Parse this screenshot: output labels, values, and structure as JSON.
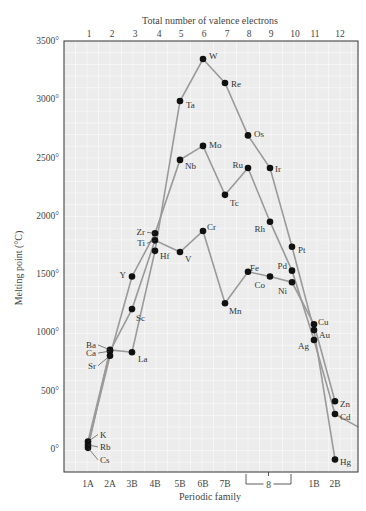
{
  "chart_data": {
    "type": "line",
    "title": "",
    "top_axis_title": "Total number of valence electrons",
    "xlabel": "Periodic family",
    "ylabel": "Melting point (°C)",
    "ylim": [
      -200,
      3500
    ],
    "y_ticks": [
      {
        "value": 3500,
        "label": "3500°"
      },
      {
        "value": 3000,
        "label": "3000°"
      },
      {
        "value": 2500,
        "label": "2500°"
      },
      {
        "value": 2000,
        "label": "2000°"
      },
      {
        "value": 1500,
        "label": "1500°"
      },
      {
        "value": 1000,
        "label": "1000°"
      },
      {
        "value": 500,
        "label": "500°"
      },
      {
        "value": 0,
        "label": "0°"
      }
    ],
    "top_ticks": [
      "1",
      "2",
      "3",
      "4",
      "5",
      "6",
      "7",
      "8",
      "9",
      "10",
      "11",
      "12"
    ],
    "bottom_ticks": [
      {
        "col": 1,
        "label": "1A"
      },
      {
        "col": 2,
        "label": "2A"
      },
      {
        "col": 3,
        "label": "3B"
      },
      {
        "col": 4,
        "label": "4B"
      },
      {
        "col": 5,
        "label": "5B"
      },
      {
        "col": 6,
        "label": "6B"
      },
      {
        "col": 7,
        "label": "7B"
      },
      {
        "col": 11,
        "label": "1B"
      },
      {
        "col": 12,
        "label": "2B"
      }
    ],
    "bracket_label": {
      "from_col": 8,
      "to_col": 10,
      "label": "8"
    },
    "grid": true,
    "legend": "none",
    "series": [
      {
        "name": "Period 4",
        "points": [
          {
            "el": "K",
            "col": 1,
            "value": 64
          },
          {
            "el": "Ca",
            "col": 2,
            "value": 840
          },
          {
            "el": "Sc",
            "col": 3,
            "value": 1200
          },
          {
            "el": "Ti",
            "col": 4,
            "value": 1790
          },
          {
            "el": "V",
            "col": 5,
            "value": 1690
          },
          {
            "el": "Cr",
            "col": 6,
            "value": 1870
          },
          {
            "el": "Mn",
            "col": 7,
            "value": 1250
          },
          {
            "el": "Fe",
            "col": 8,
            "value": 1520
          },
          {
            "el": "Co",
            "col": 9,
            "value": 1480
          },
          {
            "el": "Ni",
            "col": 10,
            "value": 1430
          },
          {
            "el": "Cu",
            "col": 11,
            "value": 1070
          },
          {
            "el": "Zn",
            "col": 12,
            "value": 410
          }
        ]
      },
      {
        "name": "Period 5",
        "points": [
          {
            "el": "Rb",
            "col": 1,
            "value": 35
          },
          {
            "el": "Sr",
            "col": 2,
            "value": 800
          },
          {
            "el": "Y",
            "col": 3,
            "value": 1480
          },
          {
            "el": "Zr",
            "col": 4,
            "value": 1850
          },
          {
            "el": "Nb",
            "col": 5,
            "value": 2480
          },
          {
            "el": "Mo",
            "col": 6,
            "value": 2600
          },
          {
            "el": "Tc",
            "col": 7,
            "value": 2180
          },
          {
            "el": "Ru",
            "col": 8,
            "value": 2410
          },
          {
            "el": "Rh",
            "col": 9,
            "value": 1950
          },
          {
            "el": "Pd",
            "col": 10,
            "value": 1530
          },
          {
            "el": "Ag",
            "col": 11,
            "value": 935
          },
          {
            "el": "Cd",
            "col": 12,
            "value": 300
          }
        ]
      },
      {
        "name": "Period 6",
        "points": [
          {
            "el": "Cs",
            "col": 1,
            "value": 10
          },
          {
            "el": "Ba",
            "col": 2,
            "value": 850
          },
          {
            "el": "La",
            "col": 3,
            "value": 830
          },
          {
            "el": "Hf",
            "col": 4,
            "value": 1700
          },
          {
            "el": "Ta",
            "col": 5,
            "value": 2985
          },
          {
            "el": "W",
            "col": 6,
            "value": 3345
          },
          {
            "el": "Re",
            "col": 7,
            "value": 3140
          },
          {
            "el": "Os",
            "col": 8,
            "value": 2690
          },
          {
            "el": "Ir",
            "col": 9,
            "value": 2410
          },
          {
            "el": "Pt",
            "col": 10,
            "value": 1735
          },
          {
            "el": "Au",
            "col": 11,
            "value": 1020
          },
          {
            "el": "Hg",
            "col": 12,
            "value": -90
          }
        ]
      }
    ],
    "tail_segment": {
      "from_el": "Cd",
      "to_value": 190
    },
    "colors": {
      "background": "#ffffff",
      "plot_bg": "#ececec",
      "grid": "#f8f8f8",
      "line": "#9a9a9a",
      "point": "#111111",
      "axis": "#333333"
    }
  }
}
